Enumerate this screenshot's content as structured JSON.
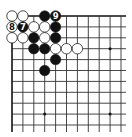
{
  "diagram": {
    "type": "go-board-partial",
    "view": "top-left corner",
    "grid": {
      "origin_x": 12,
      "origin_y": 16,
      "spacing": 10.9,
      "cols": 11,
      "rows": 11,
      "extend_right": 5,
      "extend_bottom": 7,
      "line_color": "#333333",
      "edge_color": "#111111"
    },
    "edges": {
      "top": true,
      "left": true
    },
    "hoshi": [
      {
        "col": 9,
        "row": 3
      },
      {
        "col": 3,
        "row": 9
      },
      {
        "col": 9,
        "row": 9
      }
    ],
    "stones": [
      {
        "color": "white",
        "col": 0,
        "row": 0,
        "label": ""
      },
      {
        "color": "white",
        "col": 1,
        "row": 0,
        "label": ""
      },
      {
        "color": "black",
        "col": 3,
        "row": 0,
        "label": ""
      },
      {
        "color": "black",
        "col": 4,
        "row": 0,
        "label": "9"
      },
      {
        "color": "white",
        "col": 0,
        "row": 1,
        "label": "8"
      },
      {
        "color": "black",
        "col": 1,
        "row": 1,
        "label": "7"
      },
      {
        "color": "white",
        "col": 2,
        "row": 1,
        "label": ""
      },
      {
        "color": "white",
        "col": 3,
        "row": 1,
        "label": ""
      },
      {
        "color": "black",
        "col": 4,
        "row": 1,
        "label": ""
      },
      {
        "color": "white",
        "col": 0,
        "row": 2,
        "label": ""
      },
      {
        "color": "white",
        "col": 1,
        "row": 2,
        "label": ""
      },
      {
        "color": "black",
        "col": 2,
        "row": 2,
        "label": ""
      },
      {
        "color": "white",
        "col": 3,
        "row": 2,
        "label": ""
      },
      {
        "color": "black",
        "col": 4,
        "row": 2,
        "label": ""
      },
      {
        "color": "black",
        "col": 2,
        "row": 3,
        "label": ""
      },
      {
        "color": "black",
        "col": 3,
        "row": 3,
        "label": ""
      },
      {
        "color": "white",
        "col": 4,
        "row": 3,
        "label": ""
      },
      {
        "color": "white",
        "col": 5,
        "row": 3,
        "label": ""
      },
      {
        "color": "white",
        "col": 6,
        "row": 3,
        "label": ""
      },
      {
        "color": "black",
        "col": 4,
        "row": 4,
        "label": ""
      },
      {
        "color": "black",
        "col": 3,
        "row": 5,
        "label": ""
      }
    ],
    "colors": {
      "black_stone": "#111111",
      "white_stone": "#ffffff",
      "stone_outline": "#222222",
      "label_on_black": "#ffffff",
      "label_on_white": "#111111",
      "background": "#ffffff"
    }
  }
}
